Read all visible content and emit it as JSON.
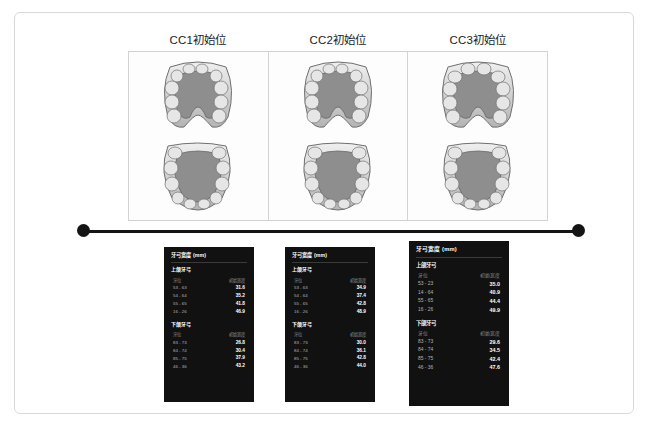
{
  "columns": [
    {
      "title": "CC1初始位"
    },
    {
      "title": "CC2初始位"
    },
    {
      "title": "CC3初始位"
    }
  ],
  "cards": [
    {
      "title": "牙弓宽度 (mm)",
      "groups": [
        {
          "label": "上颌牙弓",
          "headers": {
            "position": "牙位",
            "value": "初始宽度"
          },
          "rows": [
            {
              "position": "53 - 63",
              "value": "31.6"
            },
            {
              "position": "54 - 64",
              "value": "35.2"
            },
            {
              "position": "55 - 65",
              "value": "41.8"
            },
            {
              "position": "16 - 26",
              "value": "46.9"
            }
          ]
        },
        {
          "label": "下颌牙弓",
          "headers": {
            "position": "牙位",
            "value": "初始宽度"
          },
          "rows": [
            {
              "position": "83 - 73",
              "value": "26.8"
            },
            {
              "position": "84 - 74",
              "value": "30.4"
            },
            {
              "position": "85 - 75",
              "value": "37.9"
            },
            {
              "position": "46 - 36",
              "value": "43.2"
            }
          ]
        }
      ]
    },
    {
      "title": "牙弓宽度 (mm)",
      "groups": [
        {
          "label": "上颌牙弓",
          "headers": {
            "position": "牙位",
            "value": "初始宽度"
          },
          "rows": [
            {
              "position": "53 - 63",
              "value": "34.9"
            },
            {
              "position": "54 - 64",
              "value": "37.4"
            },
            {
              "position": "55 - 65",
              "value": "42.8"
            },
            {
              "position": "16 - 26",
              "value": "48.9"
            }
          ]
        },
        {
          "label": "下颌牙弓",
          "headers": {
            "position": "牙位",
            "value": "初始宽度"
          },
          "rows": [
            {
              "position": "83 - 73",
              "value": "30.0"
            },
            {
              "position": "84 - 74",
              "value": "36.1"
            },
            {
              "position": "85 - 75",
              "value": "42.8"
            },
            {
              "position": "46 - 36",
              "value": "44.0"
            }
          ]
        }
      ]
    },
    {
      "title": "牙弓宽度 (mm)",
      "groups": [
        {
          "label": "上颌牙弓",
          "headers": {
            "position": "牙位",
            "value": "初始宽度"
          },
          "rows": [
            {
              "position": "53 - 23",
              "value": "35.0"
            },
            {
              "position": "14 - 64",
              "value": "40.9"
            },
            {
              "position": "55 - 65",
              "value": "44.4"
            },
            {
              "position": "16 - 26",
              "value": "49.9"
            }
          ]
        },
        {
          "label": "下颌牙弓",
          "headers": {
            "position": "牙位",
            "value": "初始宽度"
          },
          "rows": [
            {
              "position": "83 - 73",
              "value": "29.6"
            },
            {
              "position": "84 - 74",
              "value": "34.5"
            },
            {
              "position": "85 - 75",
              "value": "42.4"
            },
            {
              "position": "46 - 36",
              "value": "47.6"
            }
          ]
        }
      ]
    }
  ],
  "colors": {
    "card_background": "#111111",
    "frame_border": "#d8d8d8",
    "panel_border": "#d2d2d2",
    "timeline": "#141414",
    "value_text": "#ffffff",
    "muted_text": "#8e8e8e"
  }
}
